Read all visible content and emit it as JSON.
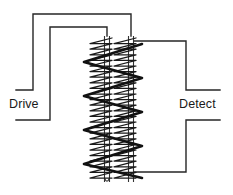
{
  "diagram": {
    "type": "electromagnetic-coil-schematic",
    "background_color": "#ffffff",
    "wire_color": "#262626",
    "winding_color": "#1a1a1a",
    "bold_winding_color": "#111111",
    "labels": {
      "drive": "Drive",
      "detect": "Detect"
    },
    "cores": [
      {
        "name": "left-core",
        "x": 107,
        "top": 36,
        "bottom": 182
      },
      {
        "name": "right-core",
        "x": 131,
        "top": 36,
        "bottom": 182
      }
    ],
    "geometry": {
      "core_left_x": 107,
      "core_right_x": 131,
      "core_top_y": 36,
      "core_bottom_y": 182,
      "fine_winding_turns": 26,
      "bold_winding_turns": 5,
      "drive_outer_top_y": 14,
      "drive_outer_left_x": 33,
      "drive_outer_stub_y": 90,
      "drive_inner_top_y": 27,
      "drive_inner_left_x": 50,
      "drive_inner_stub_y": 120,
      "detect_upper_right_x": 186,
      "detect_upper_top_y": 41,
      "detect_upper_stub_y": 90,
      "detect_lower_right_x": 186,
      "detect_lower_stub_y": 120,
      "detect_lower_bottom_y": 172
    }
  }
}
